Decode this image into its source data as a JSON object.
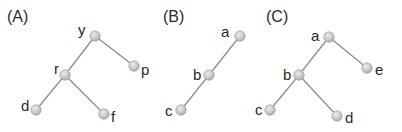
{
  "diagram": {
    "title": "",
    "colors": {
      "edge": "#8c8c8c",
      "node_fill": "#c8c8c8",
      "node_stroke": "#a9a9a9",
      "text": "#2a2a2a"
    },
    "panels": [
      {
        "label": "(A)",
        "label_pos": [
          7,
          22
        ],
        "nodes": [
          {
            "id": "y",
            "x": 95,
            "y": 36,
            "lx": 78,
            "ly": 35
          },
          {
            "id": "p",
            "x": 134,
            "y": 66,
            "lx": 141,
            "ly": 75
          },
          {
            "id": "r",
            "x": 65,
            "y": 75,
            "lx": 54,
            "ly": 74
          },
          {
            "id": "d",
            "x": 36,
            "y": 110,
            "lx": 21,
            "ly": 111
          },
          {
            "id": "f",
            "x": 104,
            "y": 114,
            "lx": 111,
            "ly": 122
          }
        ],
        "edges": [
          [
            "y",
            "p"
          ],
          [
            "y",
            "r"
          ],
          [
            "r",
            "d"
          ],
          [
            "r",
            "f"
          ]
        ]
      },
      {
        "label": "(B)",
        "label_pos": [
          163,
          22
        ],
        "nodes": [
          {
            "id": "a",
            "x": 240,
            "y": 36,
            "lx": 221,
            "ly": 37
          },
          {
            "id": "b",
            "x": 209,
            "y": 75,
            "lx": 193,
            "ly": 80
          },
          {
            "id": "c",
            "x": 181,
            "y": 110,
            "lx": 165,
            "ly": 116
          }
        ],
        "edges": [
          [
            "a",
            "b"
          ],
          [
            "b",
            "c"
          ]
        ]
      },
      {
        "label": "(C)",
        "label_pos": [
          266,
          22
        ],
        "nodes": [
          {
            "id": "a",
            "x": 329,
            "y": 37,
            "lx": 311,
            "ly": 41
          },
          {
            "id": "e",
            "x": 367,
            "y": 68,
            "lx": 375,
            "ly": 75
          },
          {
            "id": "b",
            "x": 299,
            "y": 75,
            "lx": 283,
            "ly": 80
          },
          {
            "id": "c",
            "x": 270,
            "y": 110,
            "lx": 255,
            "ly": 115
          },
          {
            "id": "d",
            "x": 337,
            "y": 116,
            "lx": 345,
            "ly": 123
          }
        ],
        "edges": [
          [
            "a",
            "e"
          ],
          [
            "a",
            "b"
          ],
          [
            "b",
            "c"
          ],
          [
            "b",
            "d"
          ]
        ]
      }
    ]
  }
}
